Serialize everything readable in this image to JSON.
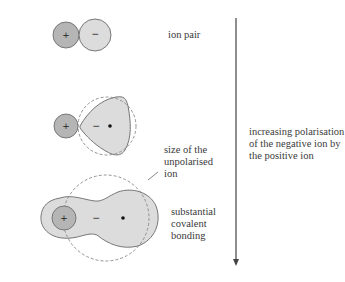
{
  "labels": {
    "ion_pair": "ion pair",
    "unpolarised": [
      "size of the",
      "unpolarised",
      "ion"
    ],
    "covalent": [
      "substantial",
      "covalent",
      "bonding"
    ],
    "arrow_caption": [
      "increasing polarisation",
      "of the negative ion by",
      "the positive ion"
    ]
  },
  "symbols": {
    "plus": "+",
    "minus": "−"
  },
  "colors": {
    "cation_fill": "#b5b5b5",
    "anion_fill": "#dcdcdc",
    "outline": "#777777",
    "dashed": "#888888",
    "arrow": "#444444"
  }
}
